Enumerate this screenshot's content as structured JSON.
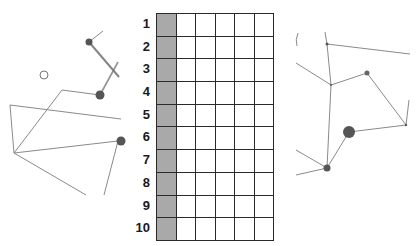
{
  "grid": {
    "row_labels": [
      "1",
      "2",
      "3",
      "4",
      "5",
      "6",
      "7",
      "8",
      "9",
      "10"
    ],
    "rows": 10,
    "columns": 6,
    "shaded_column_index": 0,
    "shaded_color": "#a9a9a9",
    "line_color": "#2a2a2a"
  },
  "left_constellation": {
    "line_color": "#8a8a8a",
    "dot_color": "#555555",
    "open_circle": {
      "cx": 44,
      "cy": 75,
      "r": 4
    }
  },
  "right_constellation": {
    "line_color": "#8a8a8a",
    "dot_color": "#555555"
  }
}
